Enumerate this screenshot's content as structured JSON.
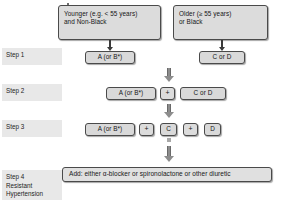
{
  "diagram": {
    "branches": [
      {
        "id": "left",
        "label": "Younger (e.g. < 55 years)\nand Non-Black"
      },
      {
        "id": "right",
        "label": "Older (≥ 55 years)\nor Black"
      }
    ],
    "steps": [
      {
        "id": "step1",
        "label": "Step 1",
        "nodes": [
          {
            "id": "step1-a",
            "label": "A (or B*)"
          },
          {
            "id": "step1-c",
            "label": "C or D"
          }
        ]
      },
      {
        "id": "step2",
        "label": "Step 2",
        "nodes": [
          {
            "id": "step2-a",
            "label": "A (or B*)"
          },
          {
            "id": "step2-plus1",
            "label": "+"
          },
          {
            "id": "step2-c",
            "label": "C or D"
          }
        ]
      },
      {
        "id": "step3",
        "label": "Step 3",
        "nodes": [
          {
            "id": "step3-a",
            "label": "A (or B*)"
          },
          {
            "id": "step3-plus1",
            "label": "+"
          },
          {
            "id": "step3-c",
            "label": "C"
          },
          {
            "id": "step3-plus2",
            "label": "+"
          },
          {
            "id": "step3-d",
            "label": "D"
          }
        ]
      },
      {
        "id": "step4",
        "label": "Step 4\nResistant\nHypertension",
        "nodes": [
          {
            "id": "step4-add",
            "label": "Add: either α-blocker or spironolactone or other diuretic"
          }
        ]
      }
    ],
    "colors": {
      "node_fill": "#d9d9d9",
      "node_border": "#4a4a4a",
      "label_band": "#e8e8e8",
      "arrow": "#8d8d8d",
      "thin_arrow": "#3a3a3a"
    }
  }
}
